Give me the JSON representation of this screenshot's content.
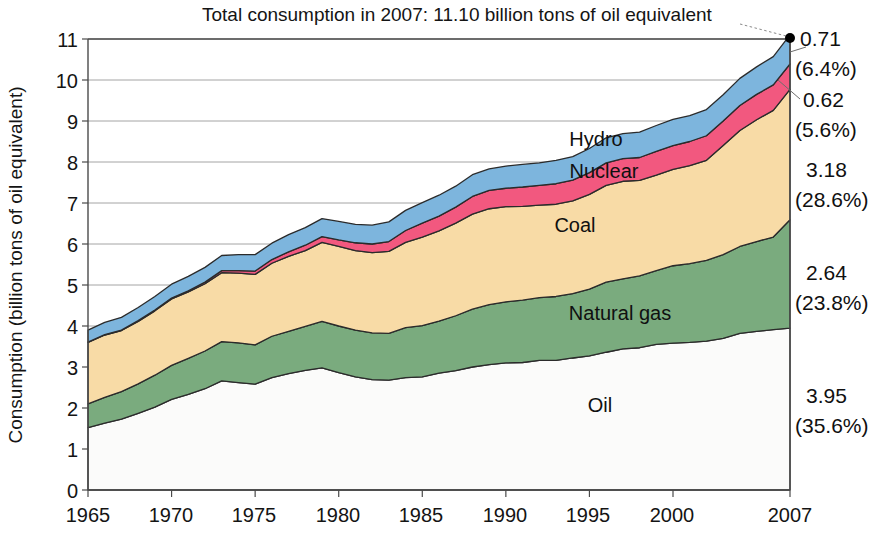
{
  "chart_data": {
    "type": "area",
    "stacked": true,
    "title": "Total consumption in 2007: 11.10 billion tons of oil equivalent",
    "xlabel": "",
    "ylabel": "Consumption (billion tons of oil equivalent)",
    "xlim": [
      1965,
      2007
    ],
    "ylim": [
      0,
      11
    ],
    "yticks": [
      "0",
      "1",
      "2",
      "3",
      "4",
      "5",
      "6",
      "7",
      "8",
      "9",
      "10",
      "11"
    ],
    "xticks": [
      "1965",
      "1970",
      "1975",
      "1980",
      "1985",
      "1990",
      "1995",
      "2000",
      "2007"
    ],
    "grid": "horizontal",
    "legend_position": "inline-labels",
    "x": [
      1965,
      1966,
      1967,
      1968,
      1969,
      1970,
      1971,
      1972,
      1973,
      1974,
      1975,
      1976,
      1977,
      1978,
      1979,
      1980,
      1981,
      1982,
      1983,
      1984,
      1985,
      1986,
      1987,
      1988,
      1989,
      1990,
      1991,
      1992,
      1993,
      1994,
      1995,
      1996,
      1997,
      1998,
      1999,
      2000,
      2001,
      2002,
      2003,
      2004,
      2005,
      2006,
      2007
    ],
    "series": [
      {
        "name": "Oil",
        "color": "#fbfbfa",
        "values": [
          1.52,
          1.63,
          1.73,
          1.87,
          2.02,
          2.21,
          2.33,
          2.47,
          2.66,
          2.62,
          2.58,
          2.74,
          2.84,
          2.92,
          2.98,
          2.86,
          2.76,
          2.69,
          2.68,
          2.74,
          2.76,
          2.85,
          2.91,
          3.0,
          3.06,
          3.1,
          3.11,
          3.16,
          3.16,
          3.22,
          3.27,
          3.36,
          3.44,
          3.47,
          3.55,
          3.58,
          3.6,
          3.63,
          3.7,
          3.82,
          3.87,
          3.91,
          3.95
        ]
      },
      {
        "name": "Natural gas",
        "color": "#7aab7e",
        "values": [
          0.58,
          0.63,
          0.67,
          0.72,
          0.78,
          0.83,
          0.88,
          0.92,
          0.96,
          0.97,
          0.96,
          1.01,
          1.03,
          1.07,
          1.13,
          1.14,
          1.14,
          1.14,
          1.14,
          1.22,
          1.25,
          1.27,
          1.34,
          1.41,
          1.46,
          1.49,
          1.52,
          1.53,
          1.56,
          1.57,
          1.63,
          1.71,
          1.71,
          1.75,
          1.8,
          1.89,
          1.92,
          1.97,
          2.04,
          2.12,
          2.19,
          2.26,
          2.64
        ]
      },
      {
        "name": "Coal",
        "color": "#f8dba6",
        "values": [
          1.5,
          1.52,
          1.49,
          1.52,
          1.57,
          1.62,
          1.62,
          1.64,
          1.68,
          1.7,
          1.72,
          1.78,
          1.83,
          1.85,
          1.93,
          1.94,
          1.94,
          1.96,
          2.0,
          2.08,
          2.16,
          2.2,
          2.26,
          2.32,
          2.34,
          2.32,
          2.29,
          2.26,
          2.25,
          2.26,
          2.31,
          2.36,
          2.38,
          2.33,
          2.33,
          2.35,
          2.39,
          2.44,
          2.66,
          2.83,
          2.97,
          3.09,
          3.18
        ]
      },
      {
        "name": "Nuclear",
        "color": "#f2587f",
        "values": [
          0.01,
          0.01,
          0.01,
          0.02,
          0.02,
          0.02,
          0.03,
          0.04,
          0.05,
          0.06,
          0.08,
          0.09,
          0.11,
          0.13,
          0.14,
          0.16,
          0.19,
          0.21,
          0.24,
          0.29,
          0.34,
          0.36,
          0.39,
          0.43,
          0.45,
          0.45,
          0.47,
          0.48,
          0.5,
          0.51,
          0.53,
          0.55,
          0.55,
          0.56,
          0.58,
          0.58,
          0.59,
          0.6,
          0.6,
          0.61,
          0.62,
          0.62,
          0.62
        ]
      },
      {
        "name": "Hydro",
        "color": "#7db5dd",
        "values": [
          0.29,
          0.3,
          0.31,
          0.32,
          0.33,
          0.34,
          0.35,
          0.36,
          0.37,
          0.39,
          0.4,
          0.4,
          0.42,
          0.43,
          0.44,
          0.45,
          0.45,
          0.46,
          0.48,
          0.49,
          0.5,
          0.51,
          0.51,
          0.53,
          0.52,
          0.54,
          0.55,
          0.55,
          0.57,
          0.57,
          0.59,
          0.61,
          0.61,
          0.62,
          0.63,
          0.64,
          0.63,
          0.64,
          0.64,
          0.66,
          0.67,
          0.69,
          0.71
        ]
      }
    ],
    "annotations_2007": [
      {
        "series": "Hydro",
        "value": "0.71",
        "percent": "(6.4%)"
      },
      {
        "series": "Nuclear",
        "value": "0.62",
        "percent": "(5.6%)"
      },
      {
        "series": "Coal",
        "value": "3.18",
        "percent": "(28.6%)"
      },
      {
        "series": "Natural gas",
        "value": "2.64",
        "percent": "(23.8%)"
      },
      {
        "series": "Oil",
        "value": "3.95",
        "percent": "(35.6%)"
      }
    ],
    "total_2007": "11.10"
  },
  "labels": {
    "hydro": "Hydro",
    "nuclear": "Nuclear",
    "coal": "Coal",
    "natural_gas": "Natural gas",
    "oil": "Oil"
  },
  "annotation_text": {
    "a0_value": "0.71",
    "a0_percent": "(6.4%)",
    "a1_value": "0.62",
    "a1_percent": "(5.6%)",
    "a2_value": "3.18",
    "a2_percent": "(28.6%)",
    "a3_value": "2.64",
    "a3_percent": "(23.8%)",
    "a4_value": "3.95",
    "a4_percent": "(35.6%)"
  },
  "yticks": {
    "t0": "0",
    "t1": "1",
    "t2": "2",
    "t3": "3",
    "t4": "4",
    "t5": "5",
    "t6": "6",
    "t7": "7",
    "t8": "8",
    "t9": "9",
    "t10": "10",
    "t11": "11"
  },
  "xticks": {
    "x0": "1965",
    "x1": "1970",
    "x2": "1975",
    "x3": "1980",
    "x4": "1985",
    "x5": "1990",
    "x6": "1995",
    "x7": "2000",
    "x8": "2007"
  }
}
